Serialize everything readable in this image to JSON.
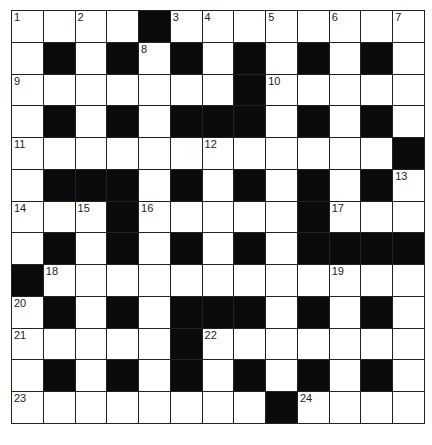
{
  "puzzle": {
    "type": "crossword",
    "rows": 13,
    "cols": 13,
    "grid": [
      "....#........",
      ".#.#.#.#.#.#.",
      ".......#.....",
      ".#.#.###.#.#.",
      "............#",
      ".###.#.#.#.#.",
      "...#.....#...",
      ".#.#.#.#.####",
      "#............",
      ".#.#.###.#.#.",
      ".....#.......",
      ".#.#.#.#.#.#.",
      "........#...."
    ],
    "numbers": [
      {
        "n": "1",
        "r": 0,
        "c": 0
      },
      {
        "n": "2",
        "r": 0,
        "c": 2
      },
      {
        "n": "3",
        "r": 0,
        "c": 5
      },
      {
        "n": "4",
        "r": 0,
        "c": 6
      },
      {
        "n": "5",
        "r": 0,
        "c": 8
      },
      {
        "n": "6",
        "r": 0,
        "c": 10
      },
      {
        "n": "7",
        "r": 0,
        "c": 12
      },
      {
        "n": "8",
        "r": 1,
        "c": 4
      },
      {
        "n": "9",
        "r": 2,
        "c": 0
      },
      {
        "n": "10",
        "r": 2,
        "c": 8
      },
      {
        "n": "11",
        "r": 4,
        "c": 0
      },
      {
        "n": "12",
        "r": 4,
        "c": 6
      },
      {
        "n": "13",
        "r": 5,
        "c": 12
      },
      {
        "n": "14",
        "r": 6,
        "c": 0
      },
      {
        "n": "15",
        "r": 6,
        "c": 2
      },
      {
        "n": "16",
        "r": 6,
        "c": 4
      },
      {
        "n": "17",
        "r": 6,
        "c": 10
      },
      {
        "n": "18",
        "r": 8,
        "c": 1
      },
      {
        "n": "19",
        "r": 8,
        "c": 10
      },
      {
        "n": "20",
        "r": 9,
        "c": 0
      },
      {
        "n": "21",
        "r": 10,
        "c": 0
      },
      {
        "n": "22",
        "r": 10,
        "c": 6
      },
      {
        "n": "23",
        "r": 12,
        "c": 0
      },
      {
        "n": "24",
        "r": 12,
        "c": 9
      }
    ],
    "colors": {
      "block": "#0a0a0a",
      "cell": "#ffffff",
      "line": "#222222"
    }
  }
}
